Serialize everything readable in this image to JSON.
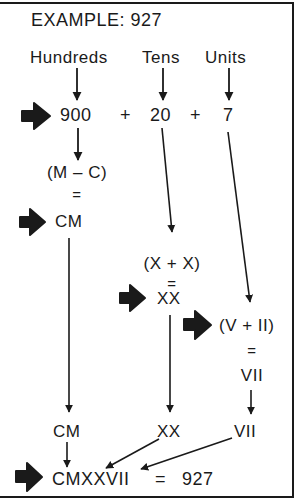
{
  "title": "EXAMPLE: 927",
  "columns": {
    "hundreds": "Hundreds",
    "tens": "Tens",
    "units": "Units"
  },
  "expansion": {
    "hundreds_value": "900",
    "plus1": "+",
    "tens_value": "20",
    "plus2": "+",
    "units_value": "7"
  },
  "hundreds_steps": {
    "expression": "(M – C)",
    "equals": "=",
    "result": "CM"
  },
  "tens_steps": {
    "expression": "(X + X)",
    "equals": "=",
    "result": "XX"
  },
  "units_steps": {
    "expression": "(V + II)",
    "equals": "=",
    "result": "VII"
  },
  "collected": {
    "hundreds": "CM",
    "tens": "XX",
    "units": "VII"
  },
  "final": {
    "numeral": "CMXXVII",
    "equals": "=",
    "value": "927"
  },
  "icons": {
    "pointer": "fat-right-arrow-icon",
    "flow": "down-arrow-icon"
  },
  "colors": {
    "ink": "#1a1a1a",
    "background": "#ffffff"
  }
}
